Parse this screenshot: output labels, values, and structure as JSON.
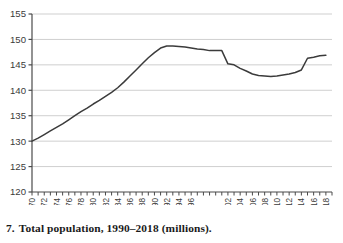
{
  "caption": {
    "number": "7.",
    "text": "Total population, 1990–2018 (millions)."
  },
  "colors": {
    "line": "#3b3b3b",
    "grid": "#c9c9c9",
    "axis": "#4a4a4a",
    "text": "#3a3a3a",
    "background": "#ffffff"
  },
  "chart_data": {
    "type": "line",
    "title": "",
    "xlabel": "",
    "ylabel": "",
    "xlim": [
      1970,
      2019
    ],
    "ylim": [
      120,
      155
    ],
    "grid": true,
    "legend": false,
    "yticks": [
      120,
      125,
      130,
      135,
      140,
      145,
      150,
      155
    ],
    "ytick_labels": [
      "120",
      "125",
      "130",
      "135",
      "140",
      "145",
      "150",
      "155"
    ],
    "xtick_labels": [
      "1970",
      "1972",
      "1974",
      "1976",
      "1978",
      "1980",
      "1982",
      "1984",
      "1986",
      "1988",
      "1990",
      "1992",
      "1994",
      "1996",
      "2002",
      "2004",
      "2006",
      "2008",
      "2010",
      "2012",
      "2014",
      "2016",
      "2018"
    ],
    "x": [
      1970,
      1971,
      1972,
      1973,
      1974,
      1975,
      1976,
      1977,
      1978,
      1979,
      1980,
      1981,
      1982,
      1983,
      1984,
      1985,
      1986,
      1987,
      1988,
      1989,
      1990,
      1991,
      1992,
      1993,
      1994,
      1995,
      1996,
      1997,
      1998,
      1999,
      2000,
      2001,
      2002,
      2003,
      2004,
      2005,
      2006,
      2007,
      2008,
      2009,
      2010,
      2011,
      2012,
      2013,
      2014,
      2015,
      2016,
      2017,
      2018
    ],
    "values": [
      130.0,
      130.6,
      131.3,
      132.0,
      132.7,
      133.4,
      134.2,
      135.0,
      135.8,
      136.5,
      137.3,
      138.0,
      138.8,
      139.6,
      140.5,
      141.6,
      142.8,
      144.0,
      145.2,
      146.4,
      147.4,
      148.3,
      148.7,
      148.7,
      148.6,
      148.5,
      148.3,
      148.1,
      148.0,
      147.8,
      147.8,
      147.8,
      145.2,
      145.0,
      144.3,
      143.8,
      143.2,
      142.9,
      142.8,
      142.7,
      142.8,
      143.0,
      143.2,
      143.5,
      144.0,
      146.3,
      146.5,
      146.8,
      146.9
    ]
  }
}
